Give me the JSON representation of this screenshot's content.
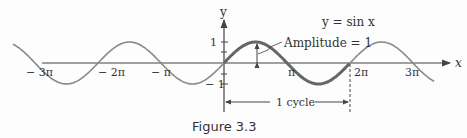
{
  "figure": {
    "caption": "Figure 3.3",
    "equation": "y = sin x",
    "amplitude_label": "Amplitude = 1",
    "cycle_label": "1  cycle",
    "y_axis_label": "y",
    "x_axis_label": "x",
    "x_ticks": [
      "− 3π",
      "− 2π",
      "− π",
      "π",
      "2π",
      "3π"
    ],
    "y_ticks": [
      "1",
      "− 1"
    ],
    "colors": {
      "curve": "#777777",
      "highlight": "#666666",
      "axis": "#444444"
    }
  },
  "chart_data": {
    "type": "line",
    "title": "y = sin x",
    "xlabel": "x",
    "ylabel": "y",
    "x_tick_labels": [
      "-3π",
      "-2π",
      "-π",
      "π",
      "2π",
      "3π"
    ],
    "y_tick_labels": [
      "1",
      "-1"
    ],
    "xlim": [
      "-3.3π",
      "3.4π"
    ],
    "ylim": [
      -1.5,
      1.5
    ],
    "series": [
      {
        "name": "sin x",
        "function": "sin(x)",
        "domain": [
          "-3.3π",
          "3.3π"
        ]
      },
      {
        "name": "one cycle (highlighted)",
        "function": "sin(x)",
        "domain": [
          0,
          "2π"
        ]
      }
    ],
    "annotations": [
      "Amplitude = 1",
      "1 cycle (0 to 2π)"
    ],
    "grid": false
  }
}
